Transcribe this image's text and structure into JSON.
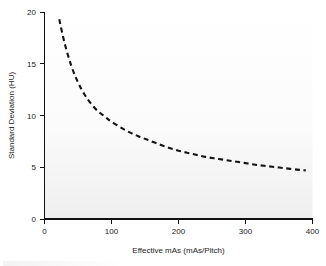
{
  "figure": {
    "background_color": "#ffffff",
    "plot_area_color": "#fdfdfd",
    "axis_color": "#111111",
    "curve_color": "#141414",
    "curve_style": "dashed"
  },
  "chart_data": {
    "type": "line",
    "title": "",
    "subtitle": "",
    "xlabel": "Effective mAs (mAs/Pitch)",
    "ylabel": "Standard Deviation (HU)",
    "xlim": [
      0,
      400
    ],
    "ylim": [
      0,
      20
    ],
    "xticks": [
      0,
      100,
      200,
      300,
      400
    ],
    "yticks": [
      0,
      5,
      10,
      15,
      20
    ],
    "xtick_labels": [
      "0",
      "100",
      "200",
      "300",
      "400"
    ],
    "ytick_labels": [
      "0",
      "5",
      "10",
      "15",
      "20"
    ],
    "grid": false,
    "legend": null,
    "legend_position": "none",
    "annotations": [],
    "series": [
      {
        "name": "Standard Deviation vs Effective mAs",
        "linestyle": "dashed",
        "color": "#141414",
        "x": [
          22,
          30,
          40,
          50,
          60,
          70,
          80,
          90,
          100,
          120,
          140,
          160,
          180,
          200,
          220,
          240,
          260,
          280,
          300,
          320,
          340,
          360,
          380,
          390
        ],
        "y": [
          19.3,
          17.0,
          14.8,
          13.2,
          12.0,
          11.1,
          10.4,
          9.9,
          9.4,
          8.6,
          8.0,
          7.5,
          7.0,
          6.6,
          6.3,
          6.0,
          5.8,
          5.6,
          5.4,
          5.2,
          5.05,
          4.9,
          4.75,
          4.7
        ]
      }
    ]
  },
  "axes": {
    "x_title": "Effective mAs (mAs/Pitch)",
    "y_title": "Standard Deviation (HU)",
    "x_tick_0": "0",
    "x_tick_1": "100",
    "x_tick_2": "200",
    "x_tick_3": "300",
    "x_tick_4": "400",
    "y_tick_0": "0",
    "y_tick_1": "5",
    "y_tick_2": "10",
    "y_tick_3": "15",
    "y_tick_4": "20"
  }
}
